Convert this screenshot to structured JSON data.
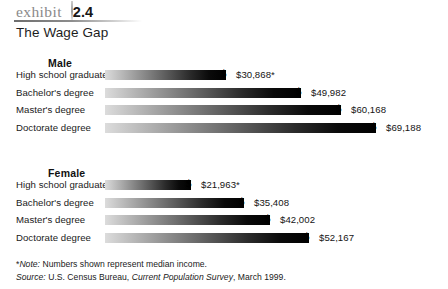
{
  "header": {
    "exhibit_word": "exhibit",
    "exhibit_number": "2.4",
    "subtitle": "The Wage Gap"
  },
  "currency_symbol": "$",
  "footnotes": {
    "note_marker": "*",
    "note_label": "Note:",
    "note_text": " Numbers shown represent median income.",
    "source_label": "Source:",
    "source_text_1": " U.S. Census Bureau, ",
    "source_italic": "Current Population Survey",
    "source_text_2": ", March 1999."
  },
  "chart_data": {
    "type": "bar",
    "title": "The Wage Gap",
    "xlabel": "",
    "ylabel": "",
    "orientation": "horizontal",
    "grid": false,
    "legend": "none",
    "xlim": [
      0,
      69188
    ],
    "categories": [
      "High school graduate",
      "Bachelor's degree",
      "Master's degree",
      "Doctorate degree"
    ],
    "series": [
      {
        "name": "Male",
        "values": [
          30868,
          49982,
          60168,
          69188
        ],
        "labels": [
          "$30,868*",
          "$49,982",
          "$60,168",
          "$69,188"
        ]
      },
      {
        "name": "Female",
        "values": [
          21963,
          35408,
          42002,
          52167
        ],
        "labels": [
          "$21,963*",
          "$35,408",
          "$42,002",
          "$52,167"
        ]
      }
    ],
    "annotations": [
      "*Note: Numbers shown represent median income.",
      "Source: U.S. Census Bureau, Current Population Survey, March 1999."
    ]
  }
}
